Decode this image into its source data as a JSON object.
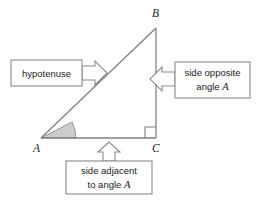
{
  "figure": {
    "background": "#ffffff",
    "stroke_color": "#7a7a7a",
    "text_color": "#1a1a1a",
    "angle_fill": "#c9c9c9"
  },
  "triangle": {
    "vertices": [
      {
        "name": "A",
        "label": "A",
        "x": 41,
        "y": 138
      },
      {
        "name": "B",
        "label": "B",
        "x": 156,
        "y": 28
      },
      {
        "name": "C",
        "label": "C",
        "x": 156,
        "y": 138
      }
    ],
    "vertex_label_positions": {
      "A": {
        "x": 33,
        "y": 152
      },
      "B": {
        "x": 152,
        "y": 17
      },
      "C": {
        "x": 152,
        "y": 152
      }
    },
    "right_angle_at": "C",
    "marked_angle_at": "A"
  },
  "callouts": [
    {
      "id": "hypotenuse",
      "lines": [
        "hypotenuse"
      ],
      "box": {
        "x": 11,
        "y": 60,
        "w": 71,
        "h": 26
      },
      "arrow_direction": "right",
      "points_to": "hypotenuse-side-AB"
    },
    {
      "id": "side-opposite",
      "lines": [
        "side opposite",
        "angle A"
      ],
      "italic_tail": "A",
      "box": {
        "x": 175,
        "y": 62,
        "w": 75,
        "h": 36
      },
      "arrow_direction": "left",
      "points_to": "side-BC"
    },
    {
      "id": "side-adjacent",
      "lines": [
        "side adjacent",
        "to angle A"
      ],
      "italic_tail": "A",
      "box": {
        "x": 66,
        "y": 161,
        "w": 86,
        "h": 33
      },
      "arrow_direction": "up",
      "points_to": "side-AC"
    }
  ]
}
